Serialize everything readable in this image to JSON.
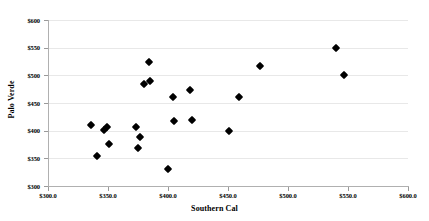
{
  "chart_data": {
    "type": "scatter",
    "title": "",
    "xlabel": "Southern Cal",
    "ylabel": "Palo Verde",
    "xlim": [
      300,
      600
    ],
    "ylim": [
      300,
      600
    ],
    "grid": true,
    "legend": null,
    "x_ticks": [
      "$300.0",
      "$350.0",
      "$400.0",
      "$450.0",
      "$500.0",
      "$550.0",
      "$600.0"
    ],
    "x_tick_values": [
      300,
      350,
      400,
      450,
      500,
      550,
      600
    ],
    "y_ticks": [
      "$300",
      "$350",
      "$400",
      "$450",
      "$500",
      "$550",
      "$600"
    ],
    "y_tick_values": [
      300,
      350,
      400,
      450,
      500,
      550,
      600
    ],
    "series": [
      {
        "name": "observations",
        "marker": "diamond",
        "color": "#000000",
        "points": [
          {
            "x": 336,
            "y": 410
          },
          {
            "x": 341,
            "y": 355
          },
          {
            "x": 347,
            "y": 401
          },
          {
            "x": 349,
            "y": 407
          },
          {
            "x": 351,
            "y": 376
          },
          {
            "x": 373,
            "y": 407
          },
          {
            "x": 375,
            "y": 369
          },
          {
            "x": 377,
            "y": 389
          },
          {
            "x": 380,
            "y": 485
          },
          {
            "x": 384,
            "y": 524
          },
          {
            "x": 385,
            "y": 489
          },
          {
            "x": 400,
            "y": 331
          },
          {
            "x": 404,
            "y": 460
          },
          {
            "x": 405,
            "y": 417
          },
          {
            "x": 418,
            "y": 473
          },
          {
            "x": 420,
            "y": 419
          },
          {
            "x": 451,
            "y": 399
          },
          {
            "x": 459,
            "y": 460
          },
          {
            "x": 477,
            "y": 516
          },
          {
            "x": 540,
            "y": 550
          },
          {
            "x": 547,
            "y": 501
          }
        ]
      }
    ]
  }
}
